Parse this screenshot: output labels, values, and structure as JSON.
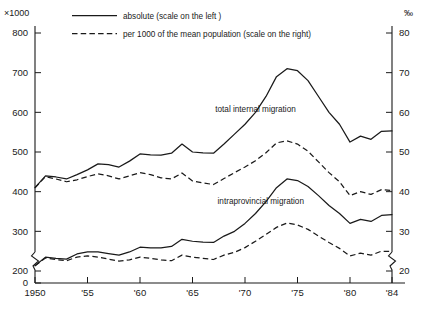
{
  "chart_data": {
    "type": "line",
    "title": "",
    "xlabel": "",
    "ylabel": "",
    "left_axis": {
      "unit_label": "×1000",
      "ticks": [
        200,
        300,
        400,
        500,
        600,
        700,
        800
      ],
      "zero_tick": 0,
      "ylim": [
        200,
        800
      ],
      "has_axis_break": true
    },
    "right_axis": {
      "unit_label": "‰",
      "ticks": [
        20,
        30,
        40,
        50,
        60,
        70,
        80
      ],
      "ylim": [
        20,
        80
      ],
      "has_axis_break": true
    },
    "x": [
      1950,
      1951,
      1952,
      1953,
      1954,
      1955,
      1956,
      1957,
      1958,
      1959,
      1960,
      1961,
      1962,
      1963,
      1964,
      1965,
      1966,
      1967,
      1968,
      1969,
      1970,
      1971,
      1972,
      1973,
      1974,
      1975,
      1976,
      1977,
      1978,
      1979,
      1980,
      1981,
      1982,
      1983,
      1984
    ],
    "xtick_values": [
      1950,
      1955,
      1960,
      1965,
      1970,
      1975,
      1980,
      1984
    ],
    "xtick_labels": [
      "1950",
      "'55",
      "'60",
      "'65",
      "'70",
      "'75",
      "'80",
      "'84"
    ],
    "xlim": [
      1950,
      1984
    ],
    "grid": false,
    "legend_position": "top-center",
    "series": [
      {
        "name": "total internal migration — absolute",
        "annotation": "total internal migration",
        "style": "solid",
        "axis": "left",
        "values": [
          410,
          440,
          437,
          432,
          443,
          455,
          470,
          468,
          462,
          477,
          495,
          493,
          492,
          497,
          520,
          500,
          498,
          497,
          520,
          545,
          570,
          600,
          640,
          690,
          710,
          705,
          680,
          640,
          600,
          570,
          525,
          540,
          532,
          552,
          553
        ]
      },
      {
        "name": "total internal migration — per 1000",
        "annotation": "",
        "style": "dashed",
        "axis": "right",
        "values": [
          41.0,
          43.8,
          43.2,
          42.5,
          43.0,
          43.8,
          44.5,
          44.0,
          43.2,
          44.0,
          44.8,
          44.3,
          43.5,
          43.2,
          44.7,
          42.7,
          42.2,
          41.8,
          43.3,
          44.8,
          46.2,
          47.8,
          49.8,
          52.3,
          52.8,
          52.0,
          50.2,
          47.5,
          44.8,
          42.5,
          39.0,
          40.0,
          39.3,
          40.5,
          40.3
        ]
      },
      {
        "name": "intraprovincial migration — absolute",
        "annotation": "intraprovincial migration",
        "style": "solid",
        "axis": "left",
        "values": [
          213,
          235,
          232,
          230,
          243,
          248,
          248,
          244,
          240,
          248,
          260,
          258,
          258,
          262,
          280,
          275,
          273,
          272,
          288,
          300,
          320,
          345,
          375,
          410,
          432,
          428,
          413,
          390,
          365,
          345,
          320,
          330,
          325,
          340,
          342
        ]
      },
      {
        "name": "intraprovincial migration — per 1000",
        "annotation": "",
        "style": "dashed",
        "axis": "right",
        "values": [
          21.3,
          23.3,
          22.9,
          22.6,
          23.5,
          23.8,
          23.5,
          23.0,
          22.5,
          22.8,
          23.5,
          23.2,
          22.8,
          22.6,
          24.0,
          23.5,
          23.2,
          22.9,
          24.0,
          24.7,
          25.9,
          27.5,
          29.2,
          31.0,
          32.1,
          31.6,
          30.5,
          28.8,
          27.2,
          25.7,
          23.8,
          24.5,
          24.0,
          25.0,
          24.9
        ]
      }
    ],
    "legend": [
      {
        "label": "absolute (scale on the left )",
        "style": "solid"
      },
      {
        "label": "per 1000 of the mean population  (scale on the right)",
        "style": "dashed"
      }
    ],
    "annotations": [
      {
        "text": "total internal migration",
        "x": 1971,
        "y_left": 600
      },
      {
        "text": "intraprovincial migration",
        "x": 1971.5,
        "y_left": 370
      }
    ],
    "colors": {
      "ink": "#1a1a1a",
      "background": "#ffffff"
    }
  }
}
